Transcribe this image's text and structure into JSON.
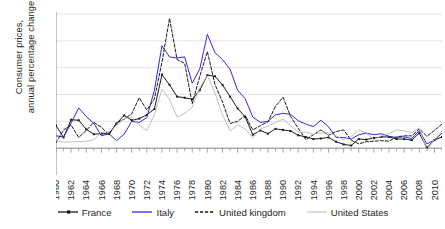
{
  "chart_data": {
    "type": "line",
    "title": "",
    "xlabel": "",
    "ylabel": "Consumer prices, annual percentage change",
    "ylabel_line1": "Consumer prices,",
    "ylabel_line2": "annual percentage change",
    "ylim": [
      -5,
      25
    ],
    "yticks": [
      -5,
      0,
      5,
      10,
      15,
      20,
      25
    ],
    "ytick_labels": [
      "−5",
      "0",
      "5",
      "10",
      "15",
      "20",
      "25"
    ],
    "xlim": [
      1960,
      2011
    ],
    "xticks": [
      1960,
      1962,
      1964,
      1966,
      1968,
      1970,
      1972,
      1974,
      1976,
      1978,
      1980,
      1982,
      1984,
      1986,
      1988,
      1990,
      1992,
      1994,
      1996,
      1998,
      2000,
      2002,
      2004,
      2006,
      2008,
      2010
    ],
    "xtick_labels": [
      "1960",
      "1962",
      "1964",
      "1966",
      "1968",
      "1970",
      "1972",
      "1974",
      "1976",
      "1978",
      "1980",
      "1982",
      "1984",
      "1986",
      "1988",
      "1990",
      "1992",
      "1994",
      "1996",
      "1998",
      "2000",
      "2002",
      "2004",
      "2006",
      "2008",
      "2010"
    ],
    "xtick_rotation": 90,
    "grid": "horizontal",
    "legend_position": "bottom",
    "x": [
      1960,
      1961,
      1962,
      1963,
      1964,
      1965,
      1966,
      1967,
      1968,
      1969,
      1970,
      1971,
      1972,
      1973,
      1974,
      1975,
      1976,
      1977,
      1978,
      1979,
      1980,
      1981,
      1982,
      1983,
      1984,
      1985,
      1986,
      1987,
      1988,
      1989,
      1990,
      1991,
      1992,
      1993,
      1994,
      1995,
      1996,
      1997,
      1998,
      1999,
      2000,
      2001,
      2002,
      2003,
      2004,
      2005,
      2006,
      2007,
      2008,
      2009,
      2010,
      2011
    ],
    "series": [
      {
        "name": "France",
        "color": "#1a1a1a",
        "style": "solid-markers",
        "values": [
          4.2,
          2.0,
          5.3,
          5.2,
          3.5,
          2.6,
          2.7,
          2.7,
          4.6,
          6.1,
          5.2,
          5.5,
          6.2,
          7.3,
          13.7,
          11.8,
          9.6,
          9.4,
          9.1,
          10.8,
          13.6,
          13.4,
          11.8,
          9.6,
          7.4,
          5.8,
          2.5,
          3.3,
          2.7,
          3.6,
          3.4,
          3.2,
          2.4,
          2.1,
          1.7,
          1.8,
          2.0,
          1.2,
          0.7,
          0.5,
          1.7,
          1.6,
          1.9,
          2.1,
          2.1,
          1.7,
          1.7,
          1.5,
          2.8,
          0.1,
          1.5,
          2.1
        ]
      },
      {
        "name": "Italy",
        "color": "#2b2be0",
        "style": "solid",
        "values": [
          2.3,
          2.1,
          4.7,
          7.5,
          5.9,
          4.6,
          2.3,
          2.7,
          1.4,
          2.6,
          5.0,
          4.8,
          5.7,
          10.8,
          19.1,
          17.0,
          16.8,
          17.0,
          12.1,
          14.8,
          21.2,
          17.8,
          16.5,
          14.7,
          10.8,
          9.2,
          5.8,
          4.8,
          5.0,
          6.2,
          6.5,
          6.3,
          5.1,
          4.5,
          4.0,
          5.2,
          4.0,
          2.0,
          2.0,
          1.7,
          2.5,
          2.8,
          2.5,
          2.7,
          2.2,
          2.0,
          2.1,
          1.8,
          3.3,
          0.8,
          1.5,
          2.8
        ]
      },
      {
        "name": "United kingdom",
        "color": "#1a1a1a",
        "style": "dashed",
        "values": [
          1.0,
          3.4,
          4.3,
          2.0,
          3.3,
          4.8,
          3.9,
          2.5,
          4.7,
          5.4,
          6.4,
          9.4,
          7.1,
          9.2,
          16.0,
          24.2,
          16.5,
          15.8,
          8.3,
          13.4,
          18.0,
          11.9,
          8.6,
          4.6,
          5.0,
          6.1,
          3.4,
          4.2,
          4.9,
          7.8,
          9.5,
          5.9,
          3.7,
          1.6,
          2.5,
          3.4,
          2.4,
          3.1,
          3.4,
          1.5,
          0.8,
          1.2,
          1.3,
          1.4,
          1.3,
          2.1,
          2.3,
          2.3,
          3.6,
          2.2,
          3.3,
          4.5
        ]
      },
      {
        "name": "United States",
        "color": "#b8b8b8",
        "style": "solid",
        "values": [
          1.5,
          1.1,
          1.2,
          1.2,
          1.3,
          1.6,
          2.9,
          3.1,
          4.2,
          5.5,
          5.8,
          4.3,
          3.3,
          6.2,
          11.0,
          9.1,
          5.8,
          6.5,
          7.6,
          11.3,
          13.5,
          10.3,
          6.2,
          3.2,
          4.3,
          3.6,
          1.9,
          3.6,
          4.1,
          4.8,
          5.4,
          4.2,
          3.0,
          3.0,
          2.6,
          2.8,
          2.9,
          2.3,
          1.6,
          2.2,
          3.4,
          2.8,
          1.6,
          2.3,
          2.7,
          3.4,
          3.2,
          2.9,
          3.8,
          -0.4,
          1.6,
          3.2
        ]
      }
    ]
  },
  "legend": {
    "items": [
      {
        "label": "France"
      },
      {
        "label": "Italy"
      },
      {
        "label": "United kingdom"
      },
      {
        "label": "United States"
      }
    ]
  }
}
